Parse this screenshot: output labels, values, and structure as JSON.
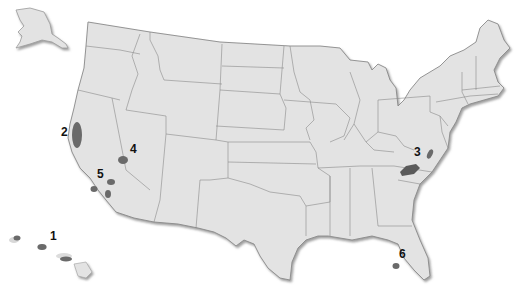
{
  "map": {
    "title": "United States map with marked regions",
    "colors": {
      "land": "#e3e3e3",
      "border": "#8a8a8a",
      "shadow": "#9a9a9a",
      "marker": "#6a6a6a",
      "background": "#ffffff",
      "label": "#111111"
    },
    "markers": [
      {
        "id": "1",
        "label": "1",
        "region": "Hawaii"
      },
      {
        "id": "2",
        "label": "2",
        "region": "Northern California coast"
      },
      {
        "id": "3",
        "label": "3",
        "region": "West Virginia / Virginia / Kentucky / Tennessee"
      },
      {
        "id": "4",
        "label": "4",
        "region": "Southern Nevada"
      },
      {
        "id": "5",
        "label": "5",
        "region": "Southern California"
      },
      {
        "id": "6",
        "label": "6",
        "region": "Florida panhandle"
      }
    ]
  }
}
